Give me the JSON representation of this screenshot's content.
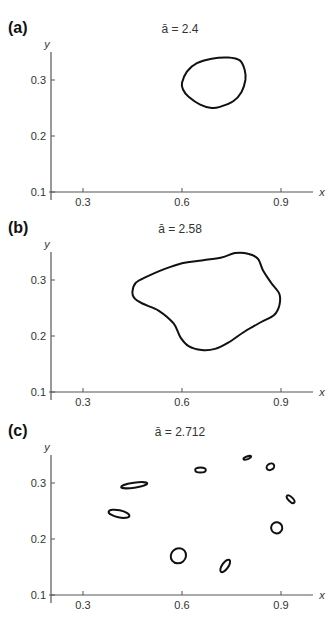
{
  "chart_data": [
    {
      "type": "line",
      "panel_label": "(a)",
      "title": "ā = 2.4",
      "xlabel": "x",
      "ylabel": "y",
      "xlim": [
        0.22,
        0.99
      ],
      "ylim": [
        0.1,
        0.35
      ],
      "xticks": [
        0.3,
        0.6,
        0.9
      ],
      "yticks": [
        0.1,
        0.2,
        0.3
      ],
      "grid": false,
      "curves": [
        {
          "name": "closed invariant curve",
          "points": [
            [
              0.6,
              0.295
            ],
            [
              0.615,
              0.315
            ],
            [
              0.645,
              0.33
            ],
            [
              0.69,
              0.338
            ],
            [
              0.74,
              0.34
            ],
            [
              0.775,
              0.335
            ],
            [
              0.79,
              0.318
            ],
            [
              0.792,
              0.3
            ],
            [
              0.78,
              0.278
            ],
            [
              0.755,
              0.262
            ],
            [
              0.715,
              0.252
            ],
            [
              0.69,
              0.25
            ],
            [
              0.655,
              0.256
            ],
            [
              0.62,
              0.27
            ],
            [
              0.603,
              0.283
            ],
            [
              0.6,
              0.295
            ]
          ]
        }
      ]
    },
    {
      "type": "line",
      "panel_label": "(b)",
      "title": "ā = 2.58",
      "xlabel": "x",
      "ylabel": "y",
      "xlim": [
        0.22,
        0.99
      ],
      "ylim": [
        0.1,
        0.35
      ],
      "xticks": [
        0.3,
        0.6,
        0.9
      ],
      "yticks": [
        0.1,
        0.2,
        0.3
      ],
      "grid": false,
      "curves": [
        {
          "name": "closed invariant curve",
          "points": [
            [
              0.45,
              0.28
            ],
            [
              0.46,
              0.295
            ],
            [
              0.49,
              0.305
            ],
            [
              0.54,
              0.318
            ],
            [
              0.6,
              0.33
            ],
            [
              0.66,
              0.335
            ],
            [
              0.72,
              0.34
            ],
            [
              0.76,
              0.348
            ],
            [
              0.8,
              0.347
            ],
            [
              0.83,
              0.338
            ],
            [
              0.845,
              0.318
            ],
            [
              0.87,
              0.295
            ],
            [
              0.895,
              0.275
            ],
            [
              0.895,
              0.255
            ],
            [
              0.88,
              0.238
            ],
            [
              0.84,
              0.225
            ],
            [
              0.79,
              0.208
            ],
            [
              0.74,
              0.188
            ],
            [
              0.7,
              0.177
            ],
            [
              0.66,
              0.175
            ],
            [
              0.62,
              0.182
            ],
            [
              0.595,
              0.198
            ],
            [
              0.575,
              0.222
            ],
            [
              0.53,
              0.245
            ],
            [
              0.48,
              0.258
            ],
            [
              0.455,
              0.268
            ],
            [
              0.45,
              0.28
            ]
          ]
        }
      ]
    },
    {
      "type": "line",
      "panel_label": "(c)",
      "title": "ā = 2.712",
      "xlabel": "x",
      "ylabel": "y",
      "xlim": [
        0.22,
        0.99
      ],
      "ylim": [
        0.1,
        0.35
      ],
      "xticks": [
        0.3,
        0.6,
        0.9
      ],
      "yticks": [
        0.1,
        0.2,
        0.3
      ],
      "grid": false,
      "islands": [
        {
          "cx": 0.455,
          "cy": 0.296,
          "rx": 0.04,
          "ry": 0.0045,
          "rot": -8
        },
        {
          "cx": 0.409,
          "cy": 0.245,
          "rx": 0.032,
          "ry": 0.0065,
          "rot": 12
        },
        {
          "cx": 0.589,
          "cy": 0.17,
          "rx": 0.024,
          "ry": 0.013,
          "rot": -40
        },
        {
          "cx": 0.731,
          "cy": 0.152,
          "rx": 0.022,
          "ry": 0.0055,
          "rot": -55
        },
        {
          "cx": 0.656,
          "cy": 0.323,
          "rx": 0.016,
          "ry": 0.0045,
          "rot": 0
        },
        {
          "cx": 0.798,
          "cy": 0.345,
          "rx": 0.012,
          "ry": 0.0025,
          "rot": -20
        },
        {
          "cx": 0.868,
          "cy": 0.329,
          "rx": 0.012,
          "ry": 0.0055,
          "rot": -30
        },
        {
          "cx": 0.929,
          "cy": 0.271,
          "rx": 0.015,
          "ry": 0.004,
          "rot": 45
        },
        {
          "cx": 0.887,
          "cy": 0.22,
          "rx": 0.017,
          "ry": 0.01,
          "rot": 10
        }
      ]
    }
  ]
}
